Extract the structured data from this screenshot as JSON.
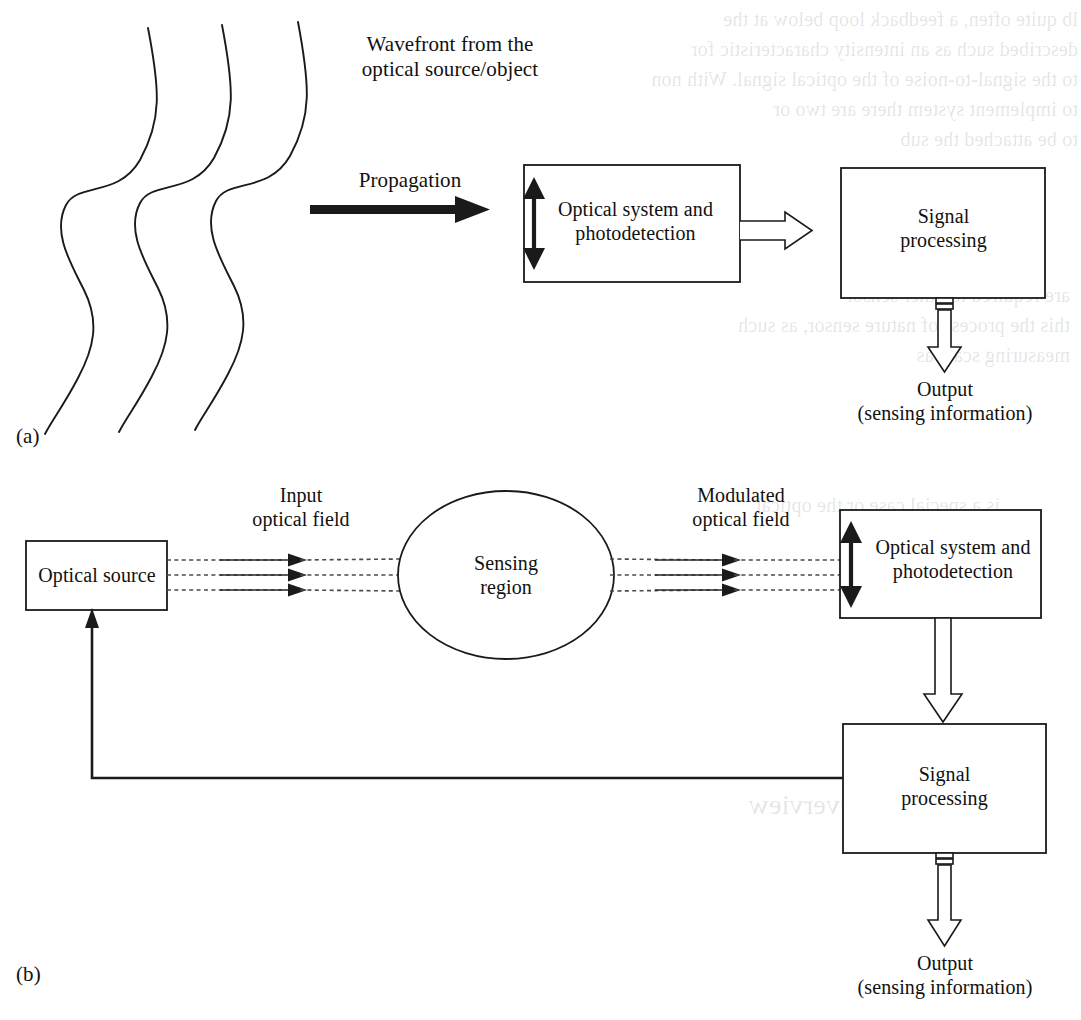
{
  "figure": {
    "panels": [
      {
        "id": "a",
        "label": "(a)"
      },
      {
        "id": "b",
        "label": "(b)"
      }
    ]
  },
  "panel_a": {
    "wavefront_label": "Wavefront from the\noptical source/object",
    "propagation_label": "Propagation",
    "optical_system_box": "Optical system and\nphotodetection",
    "signal_processing_box": "Signal\nprocessing",
    "output_label": "Output\n(sensing information)",
    "panel_tag": "(a)",
    "wavefront_count": 3,
    "icons": {
      "propagation_arrow": "solid-right-arrow-icon",
      "aperture_arrow": "double-headed-vertical-arrow-icon",
      "detector_to_processing_arrow": "hollow-right-arrow-icon",
      "processing_output_arrow": "hollow-down-arrow-icon"
    }
  },
  "panel_b": {
    "optical_source_box": "Optical source",
    "input_field_label": "Input\noptical field",
    "sensing_region_box": "Sensing\nregion",
    "modulated_field_label": "Modulated\noptical field",
    "optical_system_box": "Optical system and\nphotodetection",
    "signal_processing_box": "Signal\nprocessing",
    "output_label": "Output\n(sensing information)",
    "panel_tag": "(b)",
    "ray_count": 3,
    "icons": {
      "input_rays": "dotted-ray-arrows-icon",
      "modulated_rays": "dotted-ray-arrows-icon",
      "aperture_arrow": "double-headed-vertical-arrow-icon",
      "detector_to_processing_arrow": "hollow-down-arrow-icon",
      "processing_output_arrow": "hollow-down-arrow-icon",
      "feedback_path": "feedback-line-arrow-icon"
    }
  },
  "style": {
    "stroke": "#1a1a1a",
    "background": "#ffffff",
    "text": "#111111"
  },
  "ghost_text": {
    "top_right": "lb quite often, a feedback loop below at the\ndescribed such as an intensity characteristic for\nto the signal-to-noise of the optical signal. With non\nto implement system there are two or\nto be attached the sub",
    "mid_right": "are required to other sensor\nthis the process of nature sensor, as such\nmeasuring scale as",
    "block_left": "is a special case or the optical",
    "overview_title": "Historical Overview"
  }
}
